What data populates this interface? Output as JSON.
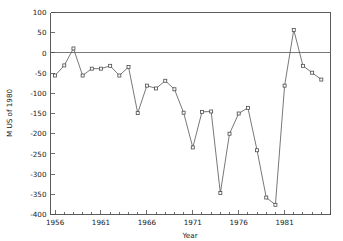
{
  "chart_data": {
    "type": "line",
    "title": "",
    "xlabel": "Year",
    "ylabel": "M US of 1980",
    "xlim": [
      1955.5,
      1986.0
    ],
    "ylim": [
      -400,
      100
    ],
    "grid": false,
    "legend": "none",
    "marker": "open-square",
    "xticks": [
      1956,
      1961,
      1966,
      1971,
      1976,
      1981
    ],
    "xtick_labels": [
      "1956",
      "1961",
      "1966",
      "1971",
      "1976",
      "1981"
    ],
    "yticks": [
      100,
      50,
      0,
      -50,
      -100,
      -150,
      -200,
      -250,
      -300,
      -350,
      -400
    ],
    "ytick_labels": [
      "100",
      "50",
      "0",
      "-50",
      "-100",
      "-150",
      "-200",
      "-250",
      "-300",
      "-350",
      "-400"
    ],
    "x": [
      1956,
      1957,
      1958,
      1959,
      1960,
      1961,
      1962,
      1963,
      1964,
      1965,
      1966,
      1967,
      1968,
      1969,
      1970,
      1971,
      1972,
      1973,
      1974,
      1975,
      1976,
      1977,
      1978,
      1979,
      1980,
      1981,
      1982,
      1983,
      1984,
      1985
    ],
    "values": [
      -56,
      -31,
      11,
      -56,
      -39,
      -39,
      -32,
      -56,
      -35,
      -149,
      -81,
      -88,
      -69,
      -90,
      -148,
      -234,
      -146,
      -145,
      -347,
      -200,
      -150,
      -136,
      -241,
      -358,
      -376,
      -81,
      57,
      -32,
      -49,
      -66
    ],
    "series": [
      {
        "name": "balance",
        "values": [
          -56,
          -31,
          11,
          -56,
          -39,
          -39,
          -32,
          -56,
          -35,
          -149,
          -81,
          -88,
          -69,
          -90,
          -148,
          -234,
          -146,
          -145,
          -347,
          -200,
          -150,
          -136,
          -241,
          -358,
          -376,
          -81,
          57,
          -32,
          -49,
          -66
        ]
      }
    ]
  },
  "axes": {
    "y_axis_title": "M US of 1980",
    "x_axis_title": "Year"
  }
}
